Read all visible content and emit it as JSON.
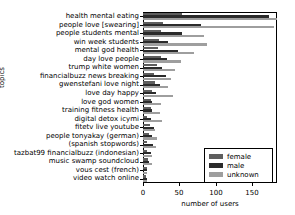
{
  "chart_data": {
    "type": "bar",
    "orientation": "horizontal",
    "grouped": true,
    "title": "",
    "xlabel": "number of users",
    "ylabel": "topics",
    "xlim": [
      0,
      184
    ],
    "xticks": [
      0,
      50,
      100,
      150
    ],
    "xticklabels": [
      "0",
      "50",
      "100",
      "150"
    ],
    "grid": false,
    "legend": {
      "position": "lower right",
      "entries": [
        "female",
        "male",
        "unknown"
      ]
    },
    "colors": {
      "female": "#5e5e5e",
      "male": "#2b2b2b",
      "unknown": "#9e9e9e"
    },
    "categories": [
      "health mental eating",
      "people love [swearing]",
      "people students mental",
      "win week students",
      "mental god health",
      "day love people",
      "trump white women",
      "financialbuzz news breaking",
      "gwenstefani love night",
      "love day happy",
      "love god women",
      "training fitness health",
      "digital detox icymi",
      "fitetv live youtube",
      "people tonyakay (german)",
      "(spanish stopwords)",
      "tazbat99 financialbuzz (indonesian)",
      "music swamp soundcloud",
      "vous cest (french)",
      "video watch online"
    ],
    "series": [
      {
        "name": "female",
        "values": [
          54,
          28,
          25,
          22,
          20,
          25,
          19,
          15,
          16,
          13,
          11,
          11,
          6,
          10,
          8,
          6,
          6,
          7,
          5,
          4
        ]
      },
      {
        "name": "male",
        "values": [
          173,
          79,
          53,
          34,
          48,
          33,
          26,
          31,
          23,
          18,
          13,
          13,
          11,
          15,
          13,
          14,
          11,
          8,
          6,
          5
        ]
      },
      {
        "name": "unknown",
        "values": [
          184,
          180,
          84,
          88,
          70,
          52,
          44,
          39,
          34,
          41,
          25,
          24,
          26,
          17,
          19,
          18,
          13,
          12,
          6,
          5
        ]
      }
    ]
  }
}
